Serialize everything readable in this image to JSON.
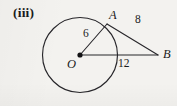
{
  "figure": {
    "part_label": "(iii)",
    "background_color": "#f3f2ef",
    "ink_color": "#1b1b1b",
    "points": [
      {
        "id": "O",
        "label": "O",
        "role": "circle-centre",
        "x": 80,
        "y": 55,
        "marker": "filled-dot"
      },
      {
        "id": "A",
        "label": "A",
        "role": "point-on-circle",
        "x": 107,
        "y": 24,
        "marker": "none"
      },
      {
        "id": "B",
        "label": "B",
        "role": "external-point",
        "x": 158,
        "y": 55,
        "marker": "none"
      }
    ],
    "circle": {
      "centre": "O",
      "cx": 80,
      "cy": 55,
      "r": 37.5
    },
    "segments": [
      {
        "id": "OA",
        "from": "O",
        "to": "A",
        "length_label": "6",
        "meaning": "radius"
      },
      {
        "id": "AB",
        "from": "A",
        "to": "B",
        "length_label": "8",
        "meaning": "tangent segment"
      },
      {
        "id": "OB",
        "from": "O",
        "to": "B",
        "length_label": "12",
        "meaning": "distance centre to external point"
      }
    ],
    "labels": {
      "A": "A",
      "B": "B",
      "O": "O",
      "OA_length": "6",
      "AB_length": "8",
      "OB_length": "12"
    }
  }
}
